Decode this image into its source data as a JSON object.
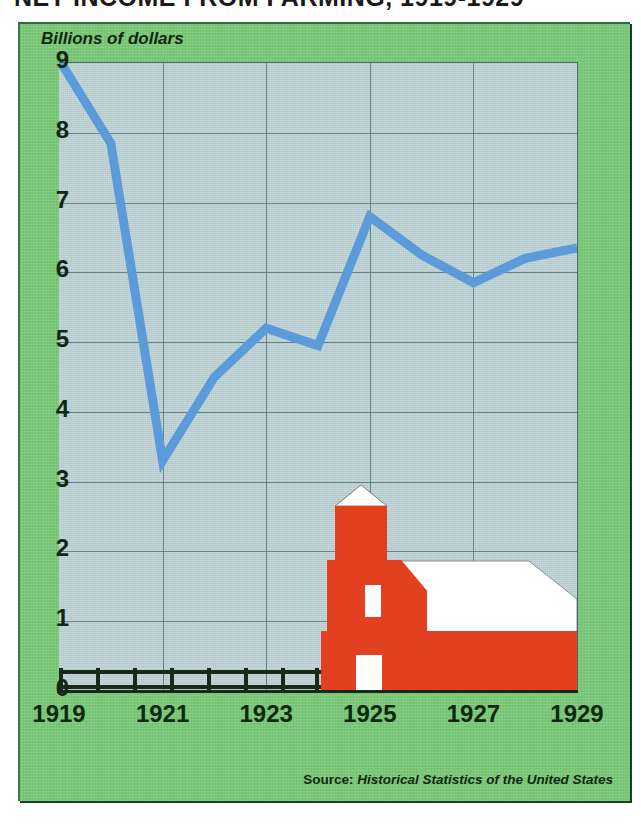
{
  "headline": "NET INCOME FROM FARMING, 1919-1929",
  "y_axis_title": "Billions of dollars",
  "source_prefix": "Source:",
  "source_title": "Historical Statistics of the United States",
  "colors": {
    "panel_green": "#79c878",
    "plot_fill": "#b9cfd2",
    "line_blue": "#5b9bd9",
    "barn_red": "#e34021",
    "roof_white": "#ffffff",
    "grid": "#56747a",
    "text_dark": "#10280f",
    "fence_black": "#18281a"
  },
  "illustration": {
    "barn_label": "red-barn",
    "silo_label": "silo",
    "fence_label": "rail-fence",
    "fence_posts": 8
  },
  "chart_data": {
    "type": "line",
    "title": "NET INCOME FROM FARMING, 1919-1929",
    "xlabel": "",
    "ylabel": "Billions of dollars",
    "grid": true,
    "legend": "none",
    "xlim": [
      1919,
      1929
    ],
    "ylim": [
      0,
      9
    ],
    "ytick_labels": [
      "9",
      "8",
      "7",
      "6",
      "5",
      "4",
      "3",
      "2",
      "1",
      "0"
    ],
    "ytick_values": [
      9,
      8,
      7,
      6,
      5,
      4,
      3,
      2,
      1,
      0
    ],
    "xtick_labels": [
      "1919",
      "1921",
      "1923",
      "1925",
      "1927",
      "1929"
    ],
    "xtick_values": [
      1919,
      1921,
      1923,
      1925,
      1927,
      1929
    ],
    "x": [
      1919,
      1920,
      1921,
      1922,
      1923,
      1924,
      1925,
      1926,
      1927,
      1928,
      1929
    ],
    "series": [
      {
        "name": "Net income from farming",
        "color": "#5b9bd9",
        "values": [
          9.05,
          7.85,
          3.3,
          4.5,
          5.2,
          4.95,
          6.8,
          6.25,
          5.85,
          6.2,
          6.35
        ]
      }
    ]
  }
}
